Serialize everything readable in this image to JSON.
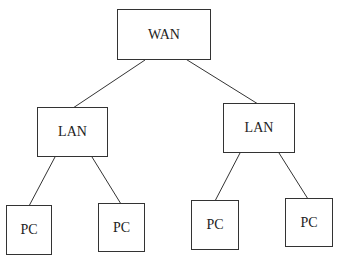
{
  "diagram": {
    "type": "tree",
    "colors": {
      "line": "#333333",
      "text": "#222222",
      "background": "#ffffff"
    },
    "nodes": [
      {
        "id": "wan",
        "label": "WAN",
        "x": 117,
        "y": 9,
        "w": 94,
        "h": 51
      },
      {
        "id": "lan1",
        "label": "LAN",
        "x": 37,
        "y": 107,
        "w": 71,
        "h": 50
      },
      {
        "id": "lan2",
        "label": "LAN",
        "x": 223,
        "y": 103,
        "w": 72,
        "h": 50
      },
      {
        "id": "pc1",
        "label": "PC",
        "x": 6,
        "y": 205,
        "w": 46,
        "h": 50
      },
      {
        "id": "pc2",
        "label": "PC",
        "x": 98,
        "y": 203,
        "w": 47,
        "h": 49
      },
      {
        "id": "pc3",
        "label": "PC",
        "x": 191,
        "y": 200,
        "w": 48,
        "h": 50
      },
      {
        "id": "pc4",
        "label": "PC",
        "x": 285,
        "y": 198,
        "w": 48,
        "h": 49
      }
    ],
    "edges": [
      {
        "from": "wan",
        "to": "lan1"
      },
      {
        "from": "wan",
        "to": "lan2"
      },
      {
        "from": "lan1",
        "to": "pc1"
      },
      {
        "from": "lan1",
        "to": "pc2"
      },
      {
        "from": "lan2",
        "to": "pc3"
      },
      {
        "from": "lan2",
        "to": "pc4"
      }
    ]
  }
}
